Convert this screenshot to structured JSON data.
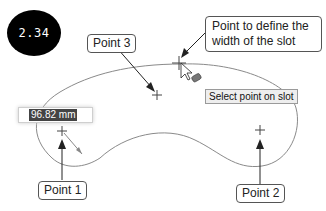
{
  "badge": {
    "label": "2.34"
  },
  "callouts": {
    "point3": "Point 3",
    "width_point_line1": "Point to define the",
    "width_point_line2": "width of the slot",
    "point1": "Point 1",
    "point2": "Point 2"
  },
  "tooltip": {
    "text": "Select point on slot"
  },
  "dimension_input": {
    "value": "96.82 mm"
  },
  "colors": {
    "curve": "#8a8a8a",
    "arrow": "#222222",
    "badge_bg": "#000000",
    "selection": "#444444"
  }
}
